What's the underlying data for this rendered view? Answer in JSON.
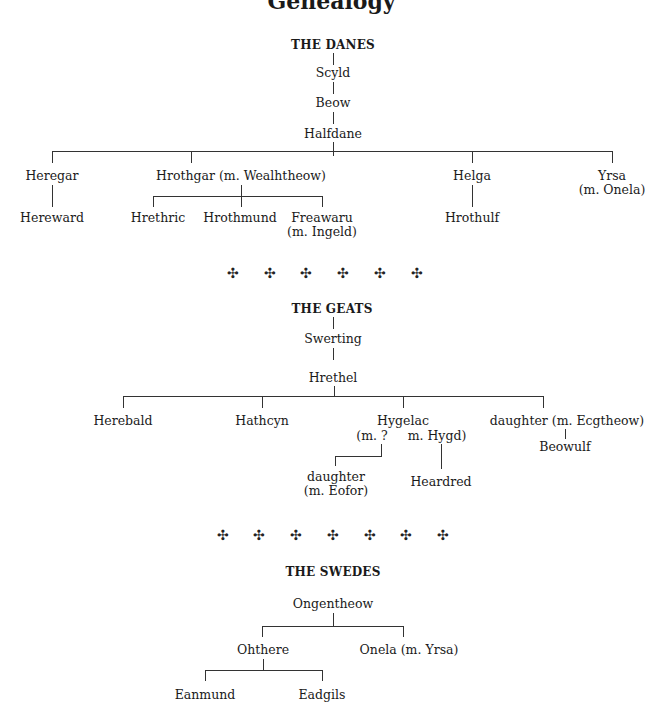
{
  "page": {
    "title_partial": "Genealogy"
  },
  "danes": {
    "heading": "THE DANES",
    "scyld": "Scyld",
    "beow": "Beow",
    "halfdane": "Halfdane",
    "heregar": "Heregar",
    "hereward": "Hereward",
    "hrothgar": "Hrothgar (m. Wealhtheow)",
    "hrethric": "Hrethric",
    "hrothmund": "Hrothmund",
    "freawaru": "Freawaru",
    "freawaru_m": "(m. Ingeld)",
    "helga": "Helga",
    "hrothulf": "Hrothulf",
    "yrsa": "Yrsa",
    "yrsa_m": "(m. Onela)"
  },
  "separator_1": {
    "glyph": "✣",
    "count": 6
  },
  "geats": {
    "heading": "THE GEATS",
    "swerting": "Swerting",
    "hrethel": "Hrethel",
    "herebald": "Herebald",
    "hathcyn": "Hathcyn",
    "hygelac": "Hygelac",
    "hygelac_m1": "(m. ?",
    "hygelac_m2": "m. Hygd)",
    "daughter_eofor": "daughter",
    "daughter_eofor_m": "(m. Eofor)",
    "heardred": "Heardred",
    "daughter_ecg": "daughter (m. Ecgtheow)",
    "beowulf": "Beowulf"
  },
  "separator_2": {
    "glyph": "✣",
    "count": 7
  },
  "swedes": {
    "heading": "THE SWEDES",
    "ongentheow": "Ongentheow",
    "ohthere": "Ohthere",
    "onela": "Onela (m. Yrsa)",
    "eanmund": "Eanmund",
    "eadgils": "Eadgils"
  },
  "ornament": "✣"
}
